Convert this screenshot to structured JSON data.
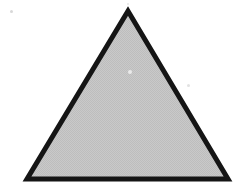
{
  "figure": {
    "kind": "geometric-shape-illustration",
    "canvas": {
      "width": 243,
      "height": 192,
      "background_color": "#ffffff"
    },
    "shape": {
      "name": "triangle",
      "type": "equilateral-triangle",
      "fill_color": "#c6c6c6",
      "fill_texture": "halftone-dither",
      "stroke_color": "#151515",
      "stroke_width": 5,
      "vertices": [
        {
          "label": "apex",
          "x": 128,
          "y": 11
        },
        {
          "label": "bottom-left",
          "x": 27,
          "y": 179
        },
        {
          "label": "bottom-right",
          "x": 228,
          "y": 179
        }
      ],
      "base_length_px": 201,
      "height_px": 168
    },
    "artifacts": [
      {
        "name": "scan-speck-top-left",
        "x": 11,
        "y": 11,
        "size": 3,
        "color": "#d8d8d8"
      },
      {
        "name": "scan-speck-center",
        "x": 130,
        "y": 72,
        "size": 4,
        "color": "#eaeaea"
      },
      {
        "name": "scan-speck-right",
        "x": 188,
        "y": 85,
        "size": 3,
        "color": "#e2e2e2"
      },
      {
        "name": "scan-speck-apex-above",
        "x": 128,
        "y": 4,
        "size": 2,
        "color": "#e6e6e6"
      }
    ]
  },
  "caption": {
    "text": ""
  }
}
